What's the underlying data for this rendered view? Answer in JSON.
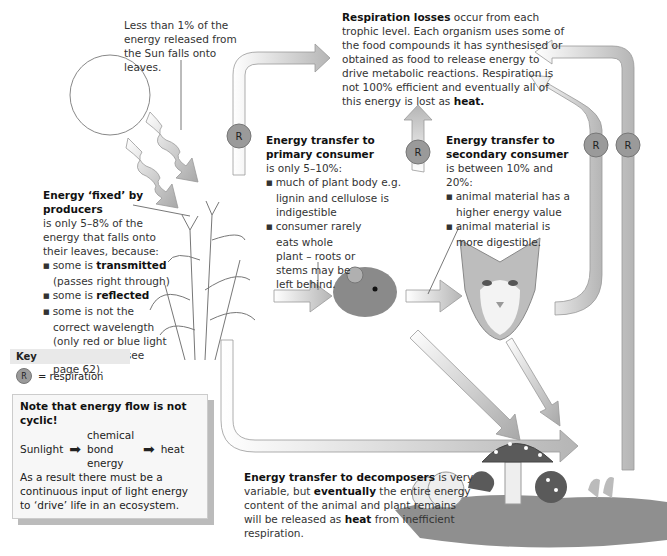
{
  "diagram": {
    "sun_note": "Less than 1% of the energy released from the Sun falls onto leaves.",
    "respiration": {
      "heading": "Respiration losses",
      "text_1": " occur from each trophic level. Each organism uses some of the food compounds it has synthesised or obtained as food to release energy to drive metabolic reactions. Respiration is not 100% efficient and eventually all of this energy is lost as ",
      "heat_word": "heat."
    },
    "producers": {
      "heading": "Energy ‘fixed’ by producers",
      "intro": "is only 5–8% of the energy that falls onto their leaves, because:",
      "bullets": [
        {
          "pre": "some is ",
          "bold": "transmitted",
          "post": " (passes right through)"
        },
        {
          "pre": "some is ",
          "bold": "reflected",
          "post": ""
        },
        {
          "pre": "some is not the correct wavelength (only red or blue light is absorbed – see page 62).",
          "bold": "",
          "post": ""
        }
      ]
    },
    "primary": {
      "heading_1": "Energy transfer to",
      "heading_2": "primary consumer",
      "intro": "is only 5–10%:",
      "bullets": [
        "much of plant body e.g. lignin and cellulose is indigestible",
        "consumer rarely eats whole plant – roots or stems may be left behind."
      ]
    },
    "secondary": {
      "heading_1": "Energy transfer to",
      "heading_2": "secondary consumer",
      "intro": "is between 10% and 20%:",
      "bullets": [
        "animal material has a higher energy value",
        "animal material is more digestible."
      ]
    },
    "decomposers": {
      "heading": "Energy transfer to decomposers",
      "text_1": " is very variable, but ",
      "bold_2": "eventually",
      "text_2": " the entire energy content of the animal and plant remains will be released as ",
      "bold_3": "heat",
      "text_3": " from inefficient respiration."
    },
    "respiration_marker": "R",
    "organisms": [
      "sun",
      "plant",
      "mouse",
      "cat",
      "fungi"
    ]
  },
  "key": {
    "title": "Key",
    "symbol": "R",
    "meaning": "= respiration"
  },
  "note": {
    "title": "Note that energy flow is not cyclic!",
    "flow": [
      "Sunlight",
      "chemical bond energy",
      "heat"
    ],
    "text": "As a result there must be a continuous input of light energy to ‘drive’ life in an ecosystem."
  },
  "colors": {
    "arrow_fill": "#c8c8c8",
    "arrow_stroke": "#8a8a8a",
    "badge": "#9a9a9a"
  }
}
